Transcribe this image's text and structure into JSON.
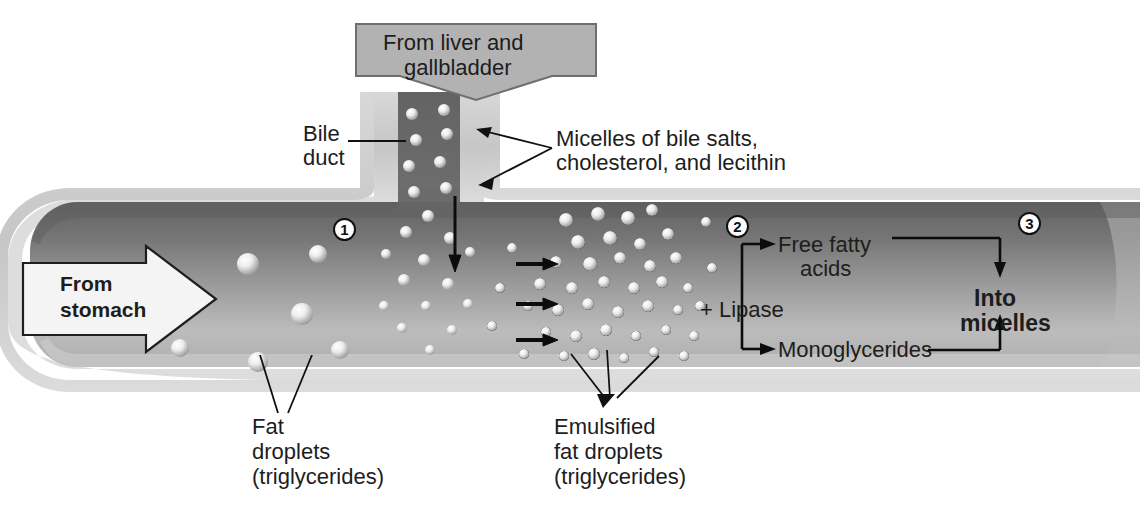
{
  "diagram": {
    "colors": {
      "banner_fill": "#b2b2b2",
      "banner_stroke": "#6e6e6e",
      "tube_rim": "#d0d0d0",
      "tube_dark": "#6d6d6d",
      "tube_light": "#c9c9c9",
      "duct_dark": "#6a6a6a",
      "arrow_fill": "#f2f2f2",
      "arrow_stroke": "#222222",
      "droplet": "#e8e8e8",
      "line": "#111111"
    }
  },
  "labels": {
    "from_liver": {
      "line1": "From liver and",
      "line2": "gallbladder"
    },
    "bile_duct": {
      "line1": "Bile",
      "line2": "duct"
    },
    "micelles": {
      "line1": "Micelles of bile salts,",
      "line2": "cholesterol, and lecithin"
    },
    "from_stomach": {
      "line1": "From",
      "line2": "stomach"
    },
    "fat_droplets": {
      "line1": "Fat",
      "line2": "droplets",
      "line3": "(triglycerides)"
    },
    "emulsified": {
      "line1": "Emulsified",
      "line2": "fat droplets",
      "line3": "(triglycerides)"
    },
    "lipase": "+ Lipase",
    "free_fatty_acids": {
      "line1": "Free fatty",
      "line2": "acids"
    },
    "monoglycerides": "Monoglycerides",
    "into_micelles": {
      "line1": "Into",
      "line2": "micelles"
    }
  },
  "steps": {
    "one": "1",
    "two": "2",
    "three": "3"
  }
}
